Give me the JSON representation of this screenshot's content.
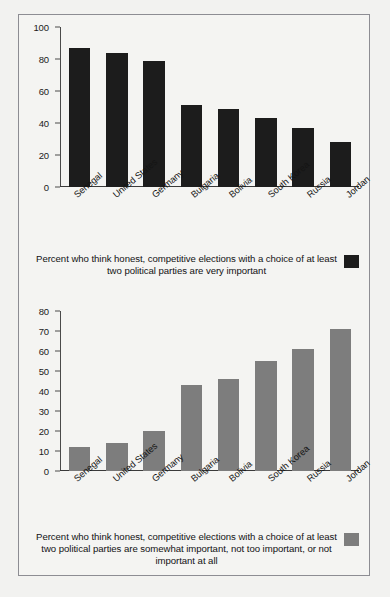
{
  "figure": {
    "background_color": "#f2f2f0",
    "frame_border_color": "#8d8d93",
    "panel_background": "#f4f4f2"
  },
  "countries": [
    "Senegal",
    "United States",
    "Germany",
    "Bulgaria",
    "Bolivia",
    "South Korea",
    "Russia",
    "Jordan"
  ],
  "panels": [
    {
      "id": "very-important",
      "legend_text": "Percent who think honest, competitive elections with a choice of at least two political parties are very important",
      "swatch_color": "#1c1c1c",
      "series_style": "dark"
    },
    {
      "id": "somewhat-or-less-important",
      "legend_text": "Percent who think honest, competitive elections with a choice of at least two political parties are somewhat important, not too important, or not important at all",
      "swatch_color": "#7d7d7d",
      "series_style": "gray"
    }
  ],
  "chart_data": [
    {
      "type": "bar",
      "title": "",
      "xlabel": "",
      "ylabel": "",
      "categories": [
        "Senegal",
        "United States",
        "Germany",
        "Bulgaria",
        "Bolivia",
        "South Korea",
        "Russia",
        "Jordan"
      ],
      "values": [
        87,
        84,
        79,
        51,
        49,
        43,
        37,
        28
      ],
      "ylim": [
        0,
        100
      ],
      "yticks": [
        0,
        20,
        40,
        60,
        80,
        100
      ],
      "ytick_labels": [
        "0",
        "20",
        "40",
        "60",
        "80",
        "100"
      ],
      "grid": false,
      "legend_position": "below",
      "legend_entries": [
        "Percent who think honest, competitive elections with a choice of at least two political parties are very important"
      ],
      "bar_color": "#1c1c1c"
    },
    {
      "type": "bar",
      "title": "",
      "xlabel": "",
      "ylabel": "",
      "categories": [
        "Senegal",
        "United States",
        "Germany",
        "Bulgaria",
        "Bolivia",
        "South Korea",
        "Russia",
        "Jordan"
      ],
      "values": [
        12,
        14,
        20,
        43,
        46,
        55,
        61,
        71
      ],
      "ylim": [
        0,
        80
      ],
      "yticks": [
        0,
        10,
        20,
        30,
        40,
        50,
        60,
        70,
        80
      ],
      "ytick_labels": [
        "0",
        "10",
        "20",
        "30",
        "40",
        "50",
        "60",
        "70",
        "80"
      ],
      "grid": false,
      "legend_position": "below",
      "legend_entries": [
        "Percent who think honest, competitive elections with a choice of at least two political parties are somewhat important, not too important, or not important at all"
      ],
      "bar_color": "#7d7d7d"
    }
  ]
}
